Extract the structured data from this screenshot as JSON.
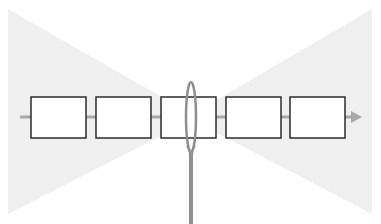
{
  "diagram": {
    "type": "schematic",
    "colors": {
      "background": "#ffffff",
      "funnel_fill": "#efefef",
      "arrow": "#a8a8a8",
      "box_stroke": "#2b2b2b",
      "box_fill": "#ffffff",
      "rod": "#8e8e8e"
    },
    "arrow": {
      "x1": 20,
      "y": 117,
      "x2": 362,
      "direction": "right"
    },
    "boxes": [
      {
        "id": "box-1",
        "x": 31,
        "y": 97,
        "w": 55,
        "h": 41
      },
      {
        "id": "box-2",
        "x": 96,
        "y": 97,
        "w": 55,
        "h": 41
      },
      {
        "id": "box-3",
        "x": 161,
        "y": 97,
        "w": 55,
        "h": 41
      },
      {
        "id": "box-4",
        "x": 226,
        "y": 97,
        "w": 55,
        "h": 41
      },
      {
        "id": "box-5",
        "x": 290,
        "y": 97,
        "w": 55,
        "h": 41
      }
    ],
    "loop": {
      "cx": 191,
      "cy": 117,
      "rx": 5,
      "ry": 35
    },
    "rod": {
      "x": 190,
      "y1": 150,
      "y2": 224
    }
  }
}
